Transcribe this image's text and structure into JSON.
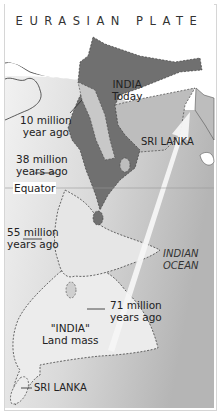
{
  "title": "EURASIAN PLATE",
  "labels": {
    "india_today": [
      "INDIA",
      "Today"
    ],
    "sri_lanka_today": "SRI LANKA",
    "ten_million": [
      "10 million",
      "year ago"
    ],
    "thirty_eight_million": [
      "38 million",
      "years ago"
    ],
    "equator": "Equator",
    "fifty_five_million": [
      "55 million",
      "years ago"
    ],
    "indian_ocean": [
      "INDIAN",
      "OCEAN"
    ],
    "seventy_one_million": [
      "71 million",
      "years ago"
    ],
    "india_land_mass": [
      "\"INDIA\"",
      "Land mass"
    ],
    "sri_lanka_past": "SRI LANKA"
  },
  "colors": {
    "india_today": "#707070",
    "ocean_light": "#e4e4e4",
    "ocean_dark": "#b8b8b8",
    "land_mass": "#ececec",
    "intermediate": "#bdbdbd",
    "arrow": "#f4f4f4"
  }
}
